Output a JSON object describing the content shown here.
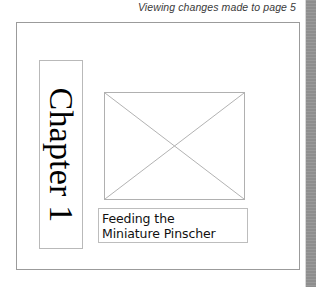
{
  "status": {
    "message": "Viewing changes made to page 5"
  },
  "page": {
    "chapter_box": {
      "title": "Chapter 1"
    },
    "image_placeholder": {
      "icon": "crossed-rectangle-image-placeholder-icon"
    },
    "caption_box": {
      "line1": "Feeding the",
      "line2": "Miniature Pinscher"
    }
  },
  "scrollbar": {
    "orientation": "vertical"
  },
  "colors": {
    "page_border": "#9b9b9b",
    "box_border": "#b9b9b9",
    "placeholder_line": "#b0b0b0",
    "status_text": "#3a3a3a",
    "scrollbar_track": "#8e8e8e",
    "background": "#ffffff"
  }
}
